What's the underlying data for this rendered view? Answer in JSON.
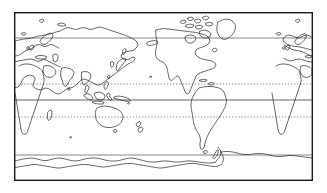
{
  "figure": {
    "projection": "equirectangular",
    "frame": {
      "x": 14,
      "y": 12,
      "width": 299,
      "height": 169,
      "border_color": "#1a1a1a",
      "border_width": 1.4,
      "fill_color": "#ffffff"
    },
    "coastline_color": "#1a1a1a",
    "coastline_width": 0.65,
    "background_color": "#ffffff"
  },
  "chart_data": {
    "type": "map",
    "xlabel": "",
    "ylabel": "",
    "xlim": [
      -30,
      330
    ],
    "ylim": [
      -90,
      90
    ],
    "grid": false,
    "legend": "none",
    "graticule": [
      {
        "name": "Arctic Circle",
        "latitude": 66.5,
        "y_px": 38,
        "style": "solid",
        "color": "#555555",
        "width": 0.7
      },
      {
        "name": "Tropic of Cancer",
        "latitude": 23.5,
        "y_px": 84,
        "style": "dotted",
        "color": "#555555",
        "width": 0.7
      },
      {
        "name": "Equator",
        "latitude": 0,
        "y_px": 100,
        "style": "solid",
        "color": "#555555",
        "width": 0.9
      },
      {
        "name": "Tropic of Capricorn",
        "latitude": -23.5,
        "y_px": 117,
        "style": "dotted",
        "color": "#555555",
        "width": 0.7
      },
      {
        "name": "Antarctic Circle",
        "latitude": -66.5,
        "y_px": 155,
        "style": "solid",
        "color": "#555555",
        "width": 0.7
      }
    ],
    "landmasses": [
      "Eurasia",
      "Africa",
      "North America",
      "South America",
      "Australia",
      "Antarctica",
      "Greenland",
      "Arabian Peninsula",
      "Indian subcontinent",
      "Scandinavia",
      "British Isles",
      "Iceland",
      "Japan",
      "Philippines",
      "Indonesia",
      "New Guinea",
      "New Zealand",
      "Madagascar",
      "Sri Lanka",
      "Canadian Arctic Archipelago",
      "Caribbean islands",
      "Tierra del Fuego",
      "Antarctic Peninsula"
    ]
  }
}
